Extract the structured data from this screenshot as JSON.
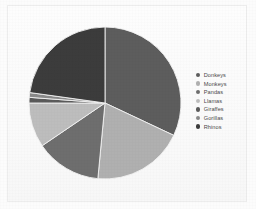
{
  "figure": {
    "background_color": "#fcfcfc",
    "frame_color": "#ededed"
  },
  "legend": {
    "position": "right",
    "entries": [
      {
        "label": "Donkeys",
        "color": "#5d5d5d"
      },
      {
        "label": "Monkeys",
        "color": "#b0b0b0"
      },
      {
        "label": "Pandas",
        "color": "#6e6e6e"
      },
      {
        "label": "Llamas",
        "color": "#bdbdbd"
      },
      {
        "label": "Giraffes",
        "color": "#5a5a5a"
      },
      {
        "label": "Gorillas",
        "color": "#8a8a8a"
      },
      {
        "label": "Rhinos",
        "color": "#3c3c3c"
      }
    ]
  },
  "chart_data": {
    "type": "pie",
    "title": "",
    "xlabel": "",
    "ylabel": "",
    "legend_position": "right",
    "grid": false,
    "start_angle_deg": 0,
    "direction": "clockwise",
    "center": {
      "x": 105,
      "y": 103
    },
    "radius": 78,
    "labels": [
      "Donkeys",
      "Monkeys",
      "Pandas",
      "Llamas",
      "Giraffes",
      "Gorillas",
      "Rhinos"
    ],
    "values": [
      32,
      19.5,
      14,
      9.5,
      1.2,
      1.0,
      22.8
    ],
    "colors": [
      "#5d5d5d",
      "#b0b0b0",
      "#6e6e6e",
      "#bdbdbd",
      "#5a5a5a",
      "#8a8a8a",
      "#3c3c3c"
    ],
    "slices": [
      {
        "label": "Donkeys",
        "value": 32,
        "percent": 32.0,
        "color": "#5d5d5d",
        "start_deg": 0,
        "end_deg": 115.2
      },
      {
        "label": "Monkeys",
        "value": 19.5,
        "percent": 19.5,
        "color": "#b0b0b0",
        "start_deg": 115.2,
        "end_deg": 185.4
      },
      {
        "label": "Pandas",
        "value": 14,
        "percent": 14.0,
        "color": "#6e6e6e",
        "start_deg": 185.4,
        "end_deg": 235.8
      },
      {
        "label": "Llamas",
        "value": 9.5,
        "percent": 9.5,
        "color": "#bdbdbd",
        "start_deg": 235.8,
        "end_deg": 270.0
      },
      {
        "label": "Giraffes",
        "value": 1.2,
        "percent": 1.2,
        "color": "#5a5a5a",
        "start_deg": 270.0,
        "end_deg": 274.3
      },
      {
        "label": "Gorillas",
        "value": 1.0,
        "percent": 1.0,
        "color": "#8a8a8a",
        "start_deg": 274.3,
        "end_deg": 277.9
      },
      {
        "label": "Rhinos",
        "value": 22.8,
        "percent": 22.8,
        "color": "#3c3c3c",
        "start_deg": 277.9,
        "end_deg": 360.0
      }
    ]
  }
}
